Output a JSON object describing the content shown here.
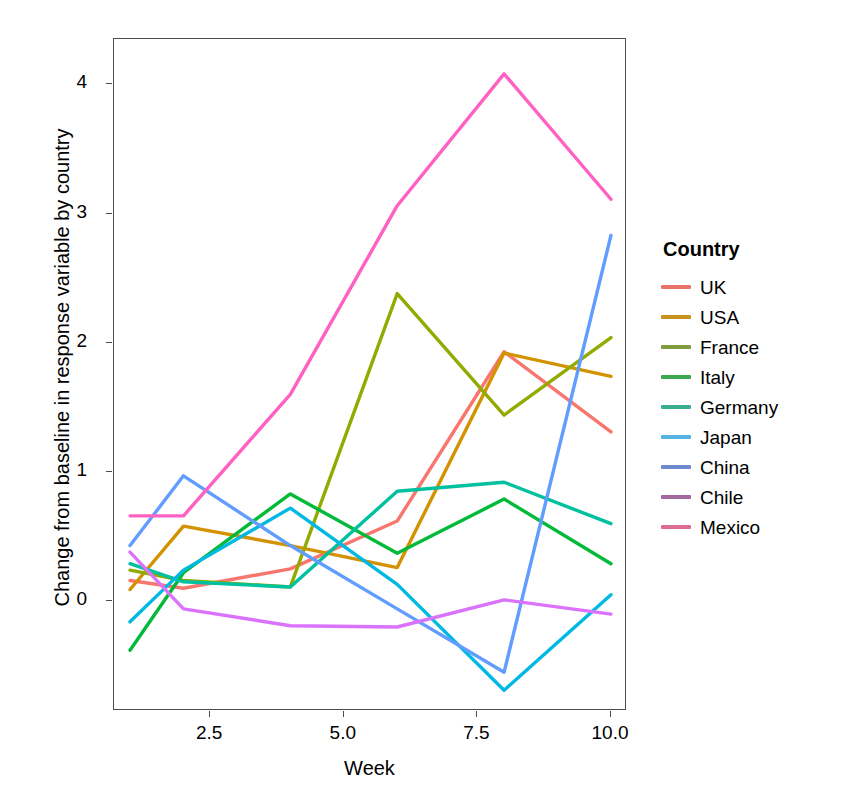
{
  "chart_data": {
    "type": "line",
    "title": "",
    "xlabel": "Week",
    "ylabel": "Change from baseline in response variable by country",
    "x": [
      1,
      2,
      4,
      6,
      8,
      10
    ],
    "xlim": [
      0.7,
      10.3
    ],
    "ylim": [
      -0.85,
      4.35
    ],
    "xticks": [
      "2.5",
      "5.0",
      "7.5",
      "10.0"
    ],
    "xtick_values": [
      2.5,
      5.0,
      7.5,
      10.0
    ],
    "yticks": [
      "0",
      "1",
      "2",
      "3",
      "4"
    ],
    "ytick_values": [
      0,
      1,
      2,
      3,
      4
    ],
    "grid": false,
    "legend_position": "right",
    "legend_title": "Country",
    "series": [
      {
        "name": "UK",
        "color": "#F8766D",
        "values": [
          0.16,
          0.1,
          0.25,
          0.62,
          1.93,
          1.31
        ]
      },
      {
        "name": "USA",
        "color": "#D39200",
        "values": [
          0.09,
          0.58,
          0.43,
          0.26,
          1.92,
          1.74
        ]
      },
      {
        "name": "France",
        "color": "#93AA00",
        "values": [
          0.24,
          0.16,
          0.11,
          2.38,
          1.44,
          2.04
        ]
      },
      {
        "name": "Italy",
        "color": "#00BA38",
        "values": [
          -0.38,
          0.22,
          0.83,
          0.37,
          0.79,
          0.29
        ]
      },
      {
        "name": "Germany",
        "color": "#00C19F",
        "values": [
          0.29,
          0.15,
          0.11,
          0.85,
          0.92,
          0.6
        ]
      },
      {
        "name": "Japan",
        "color": "#00B9E3",
        "values": [
          -0.16,
          0.24,
          0.72,
          0.13,
          -0.69,
          0.05
        ]
      },
      {
        "name": "China",
        "color": "#619CFF",
        "values": [
          0.43,
          0.97,
          0.43,
          -0.06,
          -0.55,
          2.83
        ]
      },
      {
        "name": "Chile",
        "color": "#DB72FB",
        "values": [
          0.38,
          -0.06,
          -0.19,
          -0.2,
          0.01,
          -0.1
        ]
      },
      {
        "name": "Mexico",
        "color": "#FF61C3",
        "values": [
          0.66,
          0.66,
          1.6,
          3.06,
          4.08,
          3.11
        ]
      }
    ]
  },
  "legend": {
    "title": "Country",
    "items": [
      {
        "label": "UK",
        "color": "#E8736A"
      },
      {
        "label": "USA",
        "color": "#C8921F"
      },
      {
        "label": "France",
        "color": "#7F9C3F"
      },
      {
        "label": "Italy",
        "color": "#3CA84D"
      },
      {
        "label": "Germany",
        "color": "#39AD92"
      },
      {
        "label": "Japan",
        "color": "#55B4E3"
      },
      {
        "label": "China",
        "color": "#7088CE"
      },
      {
        "label": "Chile",
        "color": "#A0699F"
      },
      {
        "label": "Mexico",
        "color": "#DE6D94"
      }
    ]
  },
  "axes": {
    "x_title": "Week",
    "y_title": "Change from baseline in response variable by country"
  }
}
